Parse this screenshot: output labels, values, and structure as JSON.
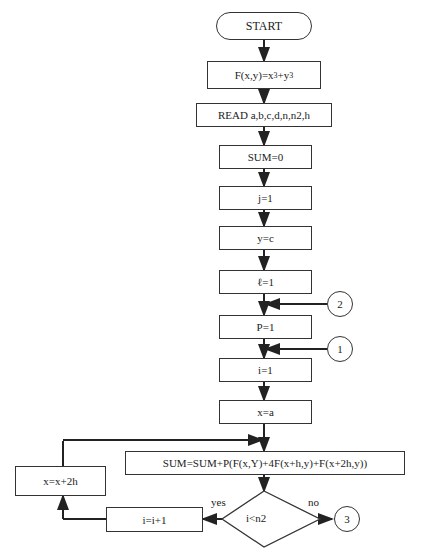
{
  "flowchart": {
    "start": "START",
    "func_def": {
      "prefix": "F(x,y)=x",
      "exp1": "3",
      "mid": "+y",
      "exp2": "3"
    },
    "read": "READ a,b,c,d,n,n2,h",
    "sum_init": "SUM=0",
    "j_init": "j=1",
    "y_init": "y=c",
    "l_init": "ℓ=1",
    "p_init": "P=1",
    "i_init": "i=1",
    "x_init": "x=a",
    "sum_update": "SUM=SUM+P(F(x,Y)+4F(x+h,y)+F(x+2h,y))",
    "decision": "i<n2",
    "yes_label": "yes",
    "no_label": "no",
    "increment_i": "i=i+1",
    "increment_x": "x=x+2h",
    "connectors": {
      "c1": "1",
      "c2": "2",
      "c3": "3"
    }
  }
}
